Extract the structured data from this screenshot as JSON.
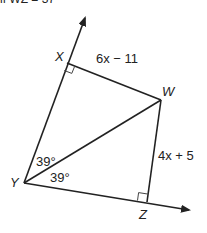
{
  "header_fragment": "if WZ = 37",
  "diagram": {
    "type": "geometry",
    "points": {
      "X": {
        "label": "X",
        "x": 67,
        "y": 63
      },
      "W": {
        "label": "W",
        "x": 161,
        "y": 100
      },
      "Y": {
        "label": "Y",
        "x": 24,
        "y": 183
      },
      "Z": {
        "label": "Z",
        "x": 147,
        "y": 202
      }
    },
    "rays": [
      {
        "from": "Y",
        "through": "X",
        "arrow_tip": {
          "x": 86,
          "y": 15
        }
      },
      {
        "from": "Y",
        "through": "Z",
        "arrow_tip": {
          "x": 191,
          "y": 210
        }
      }
    ],
    "segments": [
      {
        "from": "X",
        "to": "W",
        "label": "6x − 11"
      },
      {
        "from": "W",
        "to": "Z",
        "label": "4x + 5"
      },
      {
        "from": "Y",
        "to": "W",
        "label": ""
      }
    ],
    "right_angles": [
      "X",
      "Z"
    ],
    "angles": [
      {
        "vertex": "Y",
        "between": [
          "X",
          "W"
        ],
        "label": "39°"
      },
      {
        "vertex": "Y",
        "between": [
          "W",
          "Z"
        ],
        "label": "39°"
      }
    ],
    "colors": {
      "stroke": "#222222",
      "background": "#ffffff"
    }
  }
}
